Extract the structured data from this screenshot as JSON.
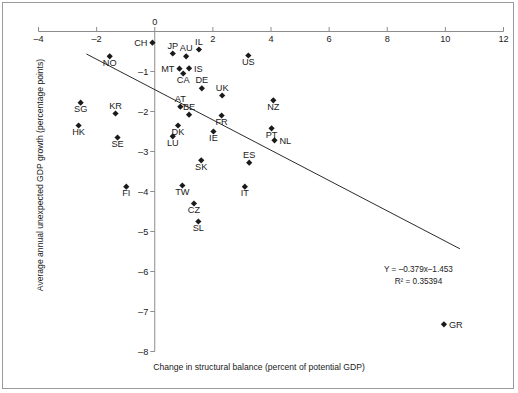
{
  "chart_data": {
    "type": "scatter",
    "title": "",
    "xlabel": "Change in structural balance (percent of potential GDP)",
    "ylabel": "Average annual unexpected GDP growth (percentage points)",
    "xlim": [
      -4,
      12
    ],
    "ylim": [
      -8,
      0.35
    ],
    "xticks": [
      -4,
      -2,
      0,
      2,
      4,
      6,
      8,
      10,
      12
    ],
    "xticklabels": [
      "–4",
      "–2",
      "0",
      "2",
      "4",
      "6",
      "8",
      "10",
      "12"
    ],
    "yticks": [
      0,
      -1,
      -2,
      -3,
      -4,
      -5,
      -6,
      -7,
      -8
    ],
    "yticklabels": [
      "0",
      "–1",
      "–2",
      "–3",
      "–4",
      "–5",
      "–6",
      "–7",
      "–8"
    ],
    "grid": false,
    "legend": null,
    "marker": "diamond",
    "marker_color": "#1a1a1a",
    "points": [
      {
        "label": "CH",
        "x": -0.08,
        "y": -0.28,
        "label_pos": "left"
      },
      {
        "label": "JP",
        "x": 0.62,
        "y": -0.55,
        "label_pos": "top"
      },
      {
        "label": "AU",
        "x": 1.08,
        "y": -0.62,
        "label_pos": "top"
      },
      {
        "label": "IL",
        "x": 1.52,
        "y": -0.45,
        "label_pos": "top"
      },
      {
        "label": "NO",
        "x": -1.55,
        "y": -0.62,
        "label_pos": "bottom"
      },
      {
        "label": "MT",
        "x": 0.85,
        "y": -0.93,
        "label_pos": "left"
      },
      {
        "label": "IS",
        "x": 1.18,
        "y": -0.92,
        "label_pos": "right"
      },
      {
        "label": "CA",
        "x": 0.98,
        "y": -1.05,
        "label_pos": "bottom"
      },
      {
        "label": "US",
        "x": 3.22,
        "y": -0.6,
        "label_pos": "bottom"
      },
      {
        "label": "DE",
        "x": 1.62,
        "y": -1.42,
        "label_pos": "top"
      },
      {
        "label": "UK",
        "x": 2.32,
        "y": -1.6,
        "label_pos": "top"
      },
      {
        "label": "NZ",
        "x": 4.08,
        "y": -1.72,
        "label_pos": "bottom"
      },
      {
        "label": "SG",
        "x": -2.55,
        "y": -1.78,
        "label_pos": "bottom"
      },
      {
        "label": "KR",
        "x": -1.35,
        "y": -2.05,
        "label_pos": "top"
      },
      {
        "label": "AT",
        "x": 0.88,
        "y": -1.88,
        "label_pos": "top"
      },
      {
        "label": "BE",
        "x": 1.18,
        "y": -2.08,
        "label_pos": "top"
      },
      {
        "label": "FR",
        "x": 2.3,
        "y": -2.1,
        "label_pos": "bottom"
      },
      {
        "label": "HK",
        "x": -2.62,
        "y": -2.35,
        "label_pos": "bottom"
      },
      {
        "label": "DK",
        "x": 0.8,
        "y": -2.35,
        "label_pos": "bottom"
      },
      {
        "label": "PT",
        "x": 4.02,
        "y": -2.42,
        "label_pos": "bottom"
      },
      {
        "label": "SE",
        "x": -1.28,
        "y": -2.65,
        "label_pos": "bottom"
      },
      {
        "label": "LU",
        "x": 0.62,
        "y": -2.62,
        "label_pos": "bottom"
      },
      {
        "label": "IE",
        "x": 2.02,
        "y": -2.5,
        "label_pos": "bottom"
      },
      {
        "label": "NL",
        "x": 4.12,
        "y": -2.72,
        "label_pos": "right"
      },
      {
        "label": "SK",
        "x": 1.6,
        "y": -3.22,
        "label_pos": "bottom"
      },
      {
        "label": "ES",
        "x": 3.25,
        "y": -3.28,
        "label_pos": "top"
      },
      {
        "label": "FI",
        "x": -0.98,
        "y": -3.88,
        "label_pos": "bottom"
      },
      {
        "label": "TW",
        "x": 0.95,
        "y": -3.85,
        "label_pos": "bottom"
      },
      {
        "label": "IT",
        "x": 3.1,
        "y": -3.88,
        "label_pos": "bottom"
      },
      {
        "label": "CZ",
        "x": 1.35,
        "y": -4.3,
        "label_pos": "bottom"
      },
      {
        "label": "SL",
        "x": 1.5,
        "y": -4.75,
        "label_pos": "bottom"
      },
      {
        "label": "GR",
        "x": 9.95,
        "y": -7.32,
        "label_pos": "right"
      }
    ],
    "trendline": {
      "equation": "Y = –0.379x–1.453",
      "r2_label": "R² = 0.35394",
      "slope": -0.379,
      "intercept": -1.453,
      "x_start": -2.35,
      "x_end": 10.5
    }
  },
  "figure": {
    "eq_line1": "Y = –0.379x–1.453",
    "eq_line2": "R² = 0.35394",
    "xlabel": "Change in structural balance (percent of potential GDP)",
    "ylabel": "Average annual unexpected GDP growth (percentage points)"
  }
}
